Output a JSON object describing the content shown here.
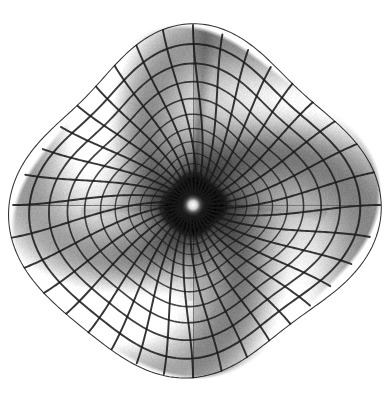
{
  "figure": {
    "kind": "surface-plot",
    "title": "",
    "background_color": "#ffffff",
    "width": 386,
    "height": 397,
    "alt_text": "Grayscale wireframe surface plot of a radially symmetric singularity funnel with four-fold pinwheel shading"
  },
  "chart_data": {
    "type": "line",
    "render": "polar-wireframe-surface",
    "title": "",
    "subtitle": "",
    "xlabel": "",
    "ylabel": "",
    "legend": [],
    "grid": true,
    "axes_visible": false,
    "tick_labels_x": [],
    "tick_labels_y": [],
    "geometry": {
      "center_x": 193,
      "center_y": 205,
      "outer_radius_x": 168,
      "outer_radius_y": 172,
      "bounds_left": 25,
      "bounds_right": 361,
      "bounds_top": 28,
      "bounds_bottom": 377,
      "boundary_shape": "rounded-square-blob",
      "boundary_squareness": 0.42,
      "boundary_rotation_deg": -8
    },
    "mesh": {
      "radial_spokes": 36,
      "concentric_rings": 16,
      "ring_spacing": "logarithmic-compressed-toward-center",
      "ring_min_radius": 0.035,
      "inner_dense_rings": 9,
      "line_color": "#1a1a1a",
      "line_width_outer": 2.1,
      "line_width_inner": 0.75,
      "line_opacity": 0.88
    },
    "shading": {
      "colormap": "grayscale",
      "min_gray": "#141414",
      "mid_gray": "#8e8e8e",
      "max_gray": "#fcfcfc",
      "lobe_count": 4,
      "lobe_twist_deg": 58,
      "pinwheel_phase_deg": 36,
      "center_highlight": true,
      "center_highlight_color": "#ffffff",
      "center_highlight_radius": 11,
      "dark_annulus_inner": 11,
      "dark_annulus_outer": 34,
      "dark_annulus_color": "#0d0d0d"
    },
    "folds": [
      {
        "name": "upper-vertical-branch-cut",
        "angle_deg": -86,
        "length_frac": 1.0,
        "contrast": 0.55
      },
      {
        "name": "left-horizontal-seam",
        "angle_deg": 177,
        "length_frac": 0.62,
        "contrast": 0.3
      },
      {
        "name": "right-horizontal-seam",
        "angle_deg": 3,
        "length_frac": 0.72,
        "contrast": 0.3
      },
      {
        "name": "lower-vertical-seam",
        "angle_deg": 92,
        "length_frac": 0.55,
        "contrast": 0.22
      }
    ],
    "quadrant_brightness": [
      {
        "quadrant": "upper-left",
        "value": 0.74
      },
      {
        "quadrant": "upper-right",
        "value": 0.46
      },
      {
        "quadrant": "lower-left",
        "value": 0.88
      },
      {
        "quadrant": "lower-right",
        "value": 0.52
      }
    ],
    "radial_profile": {
      "description": "surface height falls steeply to a singularity at the origin",
      "r": [
        1.0,
        0.85,
        0.7,
        0.55,
        0.42,
        0.3,
        0.2,
        0.12,
        0.07,
        0.035,
        0.0
      ],
      "brightness": [
        0.92,
        0.88,
        0.82,
        0.72,
        0.58,
        0.42,
        0.26,
        0.14,
        0.09,
        0.3,
        1.0
      ]
    }
  }
}
